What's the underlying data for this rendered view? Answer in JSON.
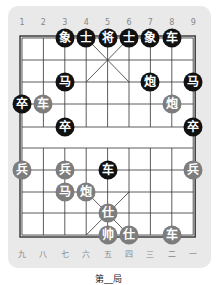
{
  "board": {
    "top_labels": [
      "1",
      "2",
      "3",
      "4",
      "5",
      "6",
      "7",
      "8",
      "9"
    ],
    "bottom_labels": [
      "九",
      "八",
      "七",
      "六",
      "五",
      "四",
      "三",
      "二",
      "一"
    ],
    "pieces": [
      {
        "side": "black",
        "char": "象",
        "col": 3,
        "row": 0
      },
      {
        "side": "black",
        "char": "士",
        "col": 4,
        "row": 0
      },
      {
        "side": "black",
        "char": "将",
        "col": 5,
        "row": 0
      },
      {
        "side": "black",
        "char": "士",
        "col": 6,
        "row": 0
      },
      {
        "side": "black",
        "char": "象",
        "col": 7,
        "row": 0
      },
      {
        "side": "black",
        "char": "车",
        "col": 8,
        "row": 0
      },
      {
        "side": "black",
        "char": "马",
        "col": 3,
        "row": 2
      },
      {
        "side": "black",
        "char": "炮",
        "col": 7,
        "row": 2
      },
      {
        "side": "black",
        "char": "马",
        "col": 9,
        "row": 2
      },
      {
        "side": "black",
        "char": "卒",
        "col": 1,
        "row": 3
      },
      {
        "side": "red",
        "char": "车",
        "col": 2,
        "row": 3
      },
      {
        "side": "red",
        "char": "炮",
        "col": 8,
        "row": 3
      },
      {
        "side": "black",
        "char": "卒",
        "col": 3,
        "row": 4
      },
      {
        "side": "black",
        "char": "卒",
        "col": 9,
        "row": 4
      },
      {
        "side": "red",
        "char": "兵",
        "col": 1,
        "row": 6
      },
      {
        "side": "red",
        "char": "兵",
        "col": 3,
        "row": 6
      },
      {
        "side": "black",
        "char": "车",
        "col": 5,
        "row": 6
      },
      {
        "side": "red",
        "char": "兵",
        "col": 9,
        "row": 6
      },
      {
        "side": "red",
        "char": "马",
        "col": 3,
        "row": 7
      },
      {
        "side": "red",
        "char": "炮",
        "col": 4,
        "row": 7
      },
      {
        "side": "red",
        "char": "仕",
        "col": 5,
        "row": 8
      },
      {
        "side": "red",
        "char": "帅",
        "col": 5,
        "row": 9
      },
      {
        "side": "red",
        "char": "仕",
        "col": 6,
        "row": 9
      },
      {
        "side": "red",
        "char": "车",
        "col": 8,
        "row": 9
      }
    ]
  },
  "caption": "第__局"
}
